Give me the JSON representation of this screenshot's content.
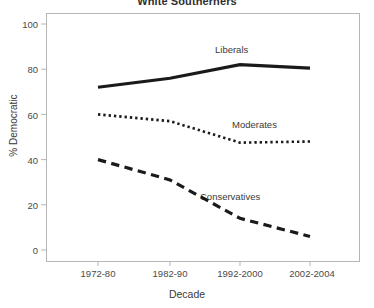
{
  "chart_data": {
    "type": "line",
    "title": "White Southerners",
    "xlabel": "Decade",
    "ylabel": "% Democratic",
    "categories": [
      "1972-80",
      "1982-90",
      "1992-2000",
      "2002-2004"
    ],
    "ylim": [
      0,
      100
    ],
    "yticks": [
      0,
      20,
      40,
      60,
      80,
      100
    ],
    "grid": false,
    "legend_position": "inline-annotations",
    "series": [
      {
        "name": "Liberals",
        "values": [
          72,
          76,
          82,
          80.5
        ],
        "style": "solid",
        "color": "#1a1a1a",
        "width": 3.2
      },
      {
        "name": "Moderates",
        "values": [
          60,
          57,
          47.5,
          48
        ],
        "style": "dotted",
        "color": "#1a1a1a",
        "width": 2.6
      },
      {
        "name": "Conservatives",
        "values": [
          40,
          31,
          14,
          6
        ],
        "style": "dashed",
        "color": "#1a1a1a",
        "width": 3.2
      }
    ],
    "annotations": [
      {
        "text": "Liberals",
        "series": "Liberals"
      },
      {
        "text": "Moderates",
        "series": "Moderates"
      },
      {
        "text": "Conservatives",
        "series": "Conservatives"
      }
    ]
  },
  "axis": {
    "y_tick_labels": [
      "100",
      "80",
      "60",
      "40",
      "20",
      "0"
    ],
    "x_tick_labels": [
      "1972-80",
      "1982-90",
      "1992-2000",
      "2002-2004"
    ]
  },
  "colors": {
    "frame": "#b6b6b6",
    "ink": "#1a1a1a",
    "text": "#3a3a3a",
    "background": "#ffffff"
  }
}
